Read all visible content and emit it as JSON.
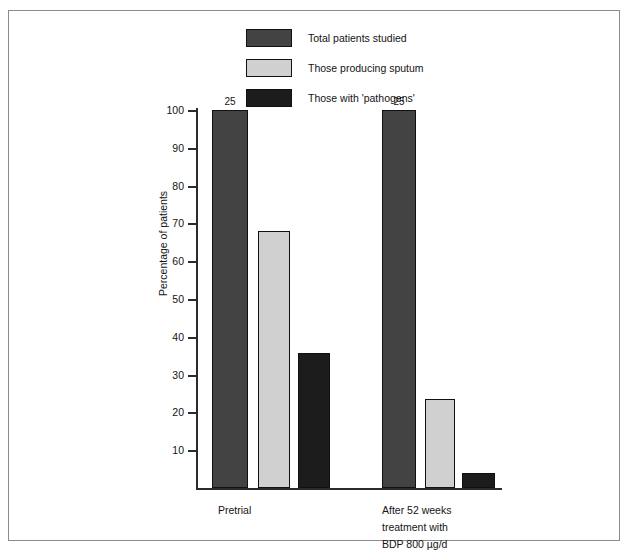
{
  "chart_data": {
    "type": "bar",
    "title": "",
    "xlabel": "",
    "ylabel": "Percentage of patients",
    "ylim": [
      0,
      100
    ],
    "yticks": [
      10,
      20,
      30,
      40,
      50,
      60,
      70,
      80,
      90,
      100
    ],
    "ytick_labels": [
      "10",
      "20",
      "30",
      "40",
      "50",
      "60",
      "70",
      "80",
      "90",
      "100"
    ],
    "grid": false,
    "legend_position": "top-center",
    "categories": [
      "Pretrial",
      "After 52 weeks treatment with BDP 800 µg/d"
    ],
    "category_lines": [
      [
        "Pretrial"
      ],
      [
        "After 52 weeks",
        "treatment with",
        "BDP 800 µg/d"
      ]
    ],
    "series": [
      {
        "name": "Total patients studied",
        "color": "#434343",
        "values": [
          100,
          100
        ],
        "data_labels": [
          "25",
          "25"
        ]
      },
      {
        "name": "Those producing sputum",
        "color": "#d0d0d0",
        "values": [
          68,
          23.5
        ],
        "data_labels": [
          "",
          ""
        ]
      },
      {
        "name": "Those with 'pathogens'",
        "color": "#1c1c1c",
        "values": [
          35.8,
          4
        ],
        "data_labels": [
          "",
          ""
        ]
      }
    ]
  },
  "legend": {
    "items": [
      {
        "label": "Total patients studied",
        "color": "#434343"
      },
      {
        "label": "Those producing sputum",
        "color": "#d0d0d0"
      },
      {
        "label": "Those with 'pathogens'",
        "color": "#1c1c1c"
      }
    ]
  },
  "axes": {
    "y_label": "Percentage of patients",
    "y_ticks": [
      "100",
      "90",
      "80",
      "70",
      "60",
      "50",
      "40",
      "30",
      "20",
      "10"
    ]
  },
  "bars": [
    {
      "group": 0,
      "series": 0,
      "value": 100,
      "label": "25",
      "color": "#434343",
      "x": 16,
      "w": 36
    },
    {
      "group": 0,
      "series": 1,
      "value": 68,
      "label": "",
      "color": "#d0d0d0",
      "x": 62,
      "w": 32
    },
    {
      "group": 0,
      "series": 2,
      "value": 35.8,
      "label": "",
      "color": "#1c1c1c",
      "x": 102,
      "w": 32
    },
    {
      "group": 1,
      "series": 0,
      "value": 100,
      "label": "25",
      "color": "#434343",
      "x": 186,
      "w": 34
    },
    {
      "group": 1,
      "series": 1,
      "value": 23.5,
      "label": "",
      "color": "#d0d0d0",
      "x": 229,
      "w": 30
    },
    {
      "group": 1,
      "series": 2,
      "value": 4,
      "label": "",
      "color": "#1c1c1c",
      "x": 266,
      "w": 33
    }
  ],
  "group_labels": [
    {
      "x": 22,
      "lines": [
        "Pretrial"
      ]
    },
    {
      "x": 186,
      "lines": [
        "After 52 weeks",
        "treatment with",
        "BDP 800 µg/d"
      ]
    }
  ]
}
